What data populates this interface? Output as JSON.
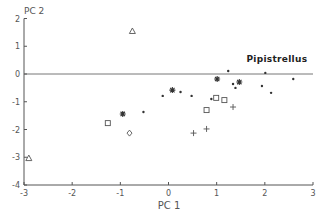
{
  "chart_data": {
    "type": "scatter",
    "title": "",
    "xlabel": "PC 1",
    "ylabel": "PC 2",
    "xlim": [
      -3,
      3
    ],
    "ylim": [
      -4,
      2
    ],
    "xticks": [
      "-3",
      "-2",
      "-1",
      "0",
      "1",
      "2",
      "3"
    ],
    "xtick_values": [
      -3,
      -2,
      -1,
      0,
      1,
      2,
      3
    ],
    "yticks": [
      "2",
      "1",
      "0",
      "-1",
      "-2",
      "-3",
      "-4"
    ],
    "ytick_values": [
      2,
      1,
      0,
      -1,
      -2,
      -3,
      -4
    ],
    "zero_line": true,
    "grid": false,
    "legend": "none",
    "annotations": [
      {
        "text": "Pipistrellus",
        "x": 2.25,
        "y": 0.45
      }
    ],
    "series": [
      {
        "name": "dot",
        "marker": "dot",
        "points": [
          [
            -0.52,
            -1.37
          ],
          [
            -0.12,
            -0.79
          ],
          [
            0.25,
            -0.65
          ],
          [
            0.48,
            -0.79
          ],
          [
            1.24,
            0.11
          ],
          [
            1.34,
            -0.36
          ],
          [
            1.39,
            -0.5
          ],
          [
            0.89,
            -0.9
          ],
          [
            2.01,
            0.04
          ],
          [
            1.94,
            -0.43
          ],
          [
            2.13,
            -0.68
          ],
          [
            2.59,
            -0.18
          ]
        ]
      },
      {
        "name": "asterisk",
        "marker": "asterisk",
        "points": [
          [
            -0.95,
            -1.44
          ],
          [
            0.08,
            -0.58
          ],
          [
            1.01,
            -0.18
          ],
          [
            1.47,
            -0.29
          ]
        ]
      },
      {
        "name": "square",
        "marker": "square",
        "points": [
          [
            -1.26,
            -1.77
          ],
          [
            0.99,
            -0.86
          ],
          [
            1.16,
            -0.94
          ],
          [
            0.79,
            -1.3
          ]
        ]
      },
      {
        "name": "triangle",
        "marker": "triangle",
        "points": [
          [
            -0.75,
            1.55
          ],
          [
            -2.9,
            -3.03
          ]
        ]
      },
      {
        "name": "diamond",
        "marker": "diamond",
        "points": [
          [
            -0.81,
            -2.13
          ]
        ]
      },
      {
        "name": "plus",
        "marker": "plus",
        "points": [
          [
            1.34,
            -1.19
          ],
          [
            0.52,
            -2.13
          ],
          [
            0.79,
            -1.98
          ]
        ]
      }
    ]
  }
}
